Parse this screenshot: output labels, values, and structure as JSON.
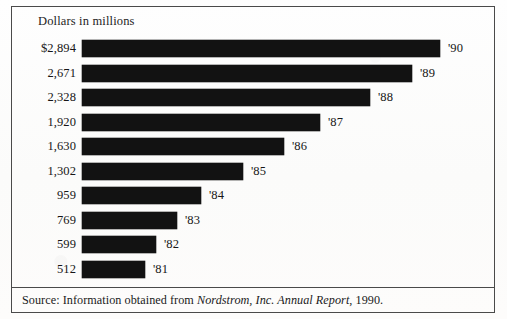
{
  "chart_data": {
    "type": "bar",
    "orientation": "horizontal",
    "title": "Dollars in millions",
    "xlabel": "",
    "ylabel": "",
    "categories": [
      "'90",
      "'89",
      "'88",
      "'87",
      "'86",
      "'85",
      "'84",
      "'83",
      "'82",
      "'81"
    ],
    "values": [
      2894,
      2671,
      2328,
      1920,
      1630,
      1302,
      959,
      769,
      599,
      512
    ],
    "value_labels": [
      "$2,894",
      "2,671",
      "2,328",
      "1,920",
      "1,630",
      "1,302",
      "959",
      "769",
      "599",
      "512"
    ],
    "xlim": [
      0,
      2894
    ],
    "grid": false,
    "legend": false,
    "bar_color": "#121212",
    "series": [
      {
        "name": "Net sales",
        "values": [
          2894,
          2671,
          2328,
          1920,
          1630,
          1302,
          959,
          769,
          599,
          512
        ]
      }
    ]
  },
  "footer": {
    "source_prefix": "Source: Information obtained from ",
    "source_italic": "Nordstrom, Inc. Annual Report",
    "source_suffix": ", 1990."
  }
}
